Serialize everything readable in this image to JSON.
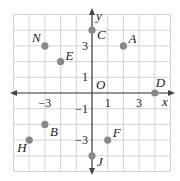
{
  "diagram": {
    "type": "coordinate-plane",
    "x_axis_label": "x",
    "y_axis_label": "y",
    "origin_label": "O",
    "range": {
      "xmin": -5,
      "xmax": 5,
      "ymin": -5,
      "ymax": 5
    },
    "x_tick_labels": [
      {
        "value": -3,
        "text": "−3"
      },
      {
        "value": 1,
        "text": "1"
      },
      {
        "value": 3,
        "text": "3"
      }
    ],
    "y_tick_labels": [
      {
        "value": 3,
        "text": "3"
      },
      {
        "value": 1,
        "text": "1"
      },
      {
        "value": -1,
        "text": "−1"
      },
      {
        "value": -3,
        "text": "−3"
      }
    ],
    "points": [
      {
        "name": "N",
        "x": -3,
        "y": 3
      },
      {
        "name": "E",
        "x": -2,
        "y": 2
      },
      {
        "name": "C",
        "x": 0,
        "y": 4
      },
      {
        "name": "A",
        "x": 2,
        "y": 3
      },
      {
        "name": "D",
        "x": 4,
        "y": 0
      },
      {
        "name": "B",
        "x": -3,
        "y": -2
      },
      {
        "name": "H",
        "x": -4,
        "y": -3
      },
      {
        "name": "F",
        "x": 1,
        "y": -3
      },
      {
        "name": "J",
        "x": 0,
        "y": -4
      }
    ],
    "colors": {
      "grid": "#d4d4d4",
      "axis": "#444444",
      "point": "#888888",
      "text": "#222222"
    }
  }
}
